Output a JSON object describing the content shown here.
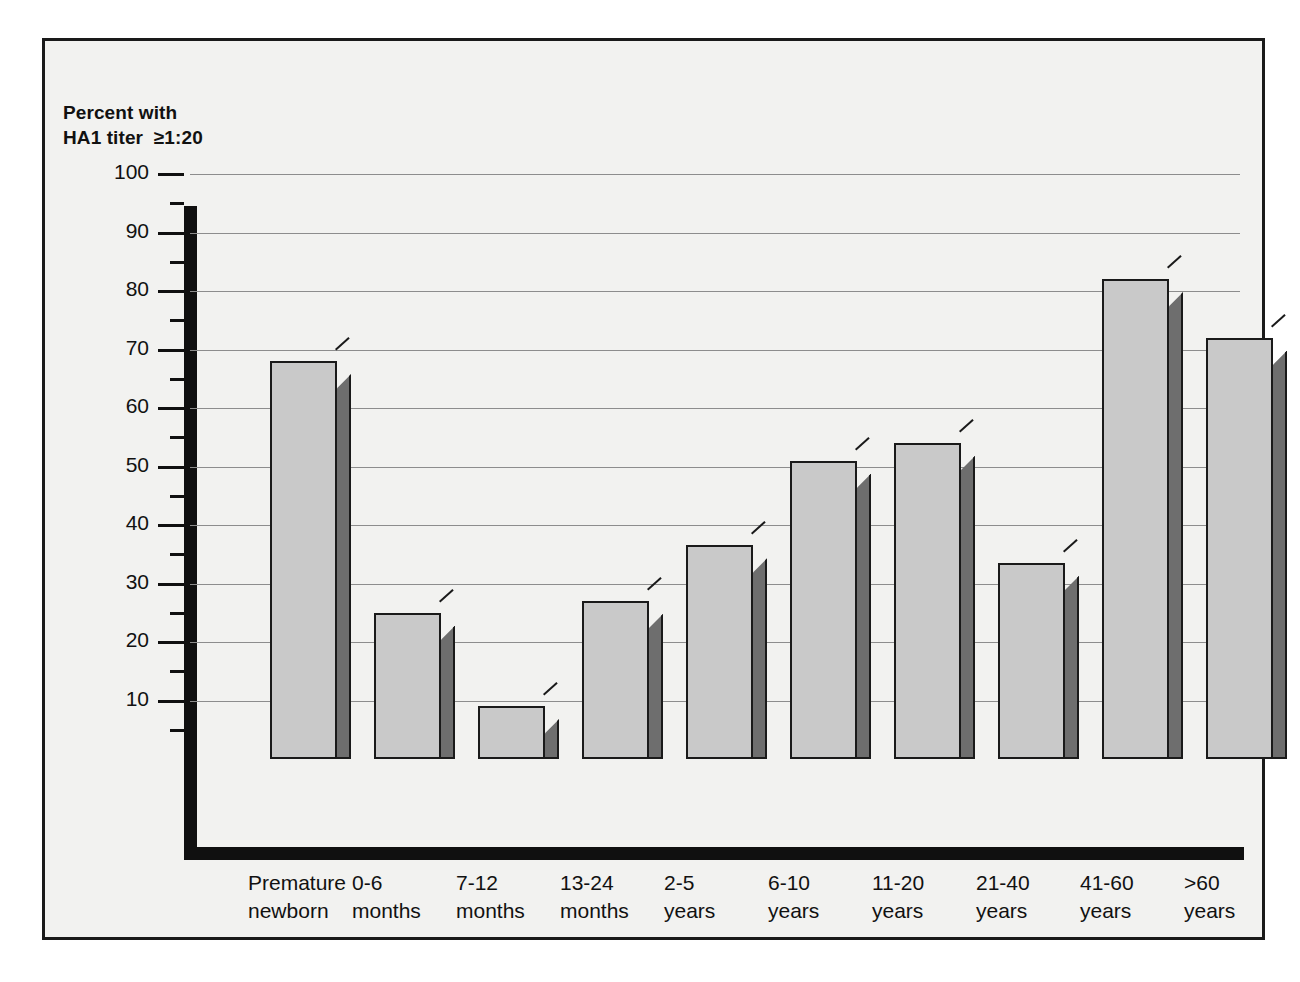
{
  "chart_data": {
    "type": "bar",
    "title": "",
    "axis_caption_line1": "Percent with",
    "axis_caption_line2": "HA1 titer  ≥1:20",
    "xlabel": "",
    "ylabel": "Percent with HA1 titer ≥1:20",
    "ylim": [
      0,
      100
    ],
    "ytick_step": 10,
    "yminor_step": 5,
    "grid": true,
    "legend": "none",
    "categories": [
      "Premature\nnewborn",
      "0-6\nmonths",
      "7-12\nmonths",
      "13-24\nmonths",
      "2-5\nyears",
      "6-10\nyears",
      "11-20\nyears",
      "21-40\nyears",
      "41-60\nyears",
      ">60\nyears"
    ],
    "values": [
      68,
      25,
      9,
      27,
      36.5,
      51,
      54,
      33.5,
      82,
      72
    ],
    "yticks": [
      10,
      20,
      30,
      40,
      50,
      60,
      70,
      80,
      90,
      100
    ],
    "colors": {
      "bar_front": "#c9c9c9",
      "bar_side": "#6e6e6e",
      "outline": "#1a1a1a",
      "gridline": "#8d8d8d",
      "axis": "#101010",
      "background": "#f2f2f0",
      "text": "#111111"
    }
  }
}
